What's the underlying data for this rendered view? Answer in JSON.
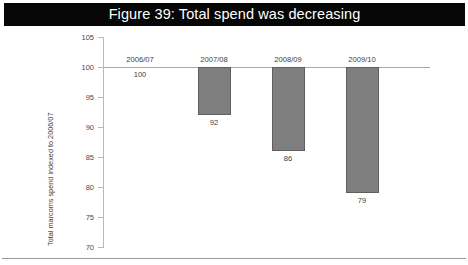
{
  "figure": {
    "title": "Figure 39: Total spend was decreasing",
    "title_bar_color": "#060606",
    "title_text_color": "#ffffff"
  },
  "chart_data": {
    "type": "bar",
    "title": "Figure 39: Total spend was decreasing",
    "xlabel": "",
    "ylabel": "Total marcoms spend indexed to 2006/07",
    "categories": [
      "2006/07",
      "2007/08",
      "2008/09",
      "2009/10"
    ],
    "values": [
      100,
      92,
      86,
      79
    ],
    "data_labels": [
      "100",
      "92",
      "86",
      "79"
    ],
    "ylim": [
      70,
      105
    ],
    "yticks": [
      70,
      75,
      80,
      85,
      90,
      95,
      100,
      105
    ],
    "ytick_labels": [
      "70",
      "75",
      "80",
      "85",
      "90",
      "95",
      "100",
      "105"
    ],
    "baseline": 100,
    "grid": false,
    "legend": null,
    "bar_color": "#7f7f7f",
    "bar_edge_color": "#5f5f5f",
    "axis_color": "#b9b9b9",
    "note": "Bars hang downward from the 100 baseline; the 2006/07 category equals the baseline so no bar is drawn."
  }
}
